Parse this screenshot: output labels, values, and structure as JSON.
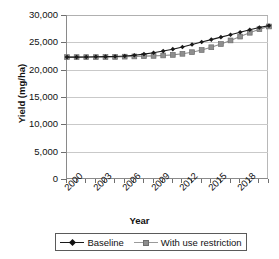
{
  "chart_data": {
    "type": "line",
    "title": "",
    "xlabel": "Year",
    "ylabel": "Yield (mg/ha)",
    "ylim": [
      0,
      30000
    ],
    "xlim": [
      2000,
      2021
    ],
    "grid": true,
    "legend_position": "bottom",
    "y_ticks": [
      "0",
      "5,000",
      "10,000",
      "15,000",
      "20,000",
      "25,000",
      "30,000"
    ],
    "y_tick_values": [
      0,
      5000,
      10000,
      15000,
      20000,
      25000,
      30000
    ],
    "x_tick_labels": [
      "2000",
      "2003",
      "2006",
      "2009",
      "2012",
      "2015",
      "2018"
    ],
    "x_tick_label_values": [
      2000,
      2003,
      2006,
      2009,
      2012,
      2015,
      2018
    ],
    "x": [
      2000,
      2001,
      2002,
      2003,
      2004,
      2005,
      2006,
      2007,
      2008,
      2009,
      2010,
      2011,
      2012,
      2013,
      2014,
      2015,
      2016,
      2017,
      2018,
      2019,
      2020,
      2021
    ],
    "series": [
      {
        "name": "Baseline",
        "color": "#1a1a1a",
        "marker": "diamond",
        "values": [
          22300,
          22300,
          22320,
          22350,
          22380,
          22420,
          22500,
          22650,
          22850,
          23100,
          23400,
          23750,
          24150,
          24600,
          25050,
          25500,
          25950,
          26400,
          26850,
          27300,
          27700,
          28050
        ]
      },
      {
        "name": "With use restriction",
        "color": "#8e8e8e",
        "marker": "square",
        "values": [
          22300,
          22300,
          22300,
          22300,
          22310,
          22330,
          22380,
          22420,
          22470,
          22520,
          22600,
          22700,
          22900,
          23200,
          23600,
          24100,
          24700,
          25350,
          26050,
          26750,
          27400,
          27900
        ]
      }
    ]
  },
  "legend": {
    "items": [
      {
        "label": "Baseline"
      },
      {
        "label": "With use restriction"
      }
    ]
  }
}
